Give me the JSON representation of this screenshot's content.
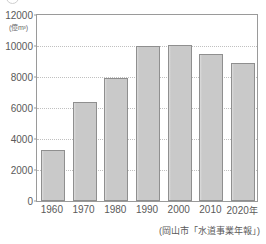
{
  "chart_data": {
    "type": "bar",
    "title": "",
    "subtitle": "",
    "xlabel": "",
    "ylabel": "",
    "unit_label": "(億m³)",
    "categories": [
      "1960",
      "1970",
      "1980",
      "1990",
      "2000",
      "2010",
      "2020"
    ],
    "category_suffix": "年",
    "values": [
      3300,
      6400,
      7950,
      10000,
      10050,
      9500,
      8900
    ],
    "ylim": [
      0,
      12000
    ],
    "ytick_labels": [
      "0",
      "2000",
      "4000",
      "6000",
      "8000",
      "10000",
      "12000"
    ],
    "ytick_values": [
      0,
      2000,
      4000,
      6000,
      8000,
      10000,
      12000
    ],
    "grid": true,
    "grid_style": "dotted",
    "legend": "none",
    "source_note": "(岡山市「水道事業年報」)",
    "colors": {
      "bar_fill": "#c9c9c9",
      "bar_border": "#8f8f8f",
      "grid": "#c0c0c0",
      "frame": "#9a9a9a",
      "text": "#5a5a5a",
      "background": "#ffffff"
    }
  }
}
